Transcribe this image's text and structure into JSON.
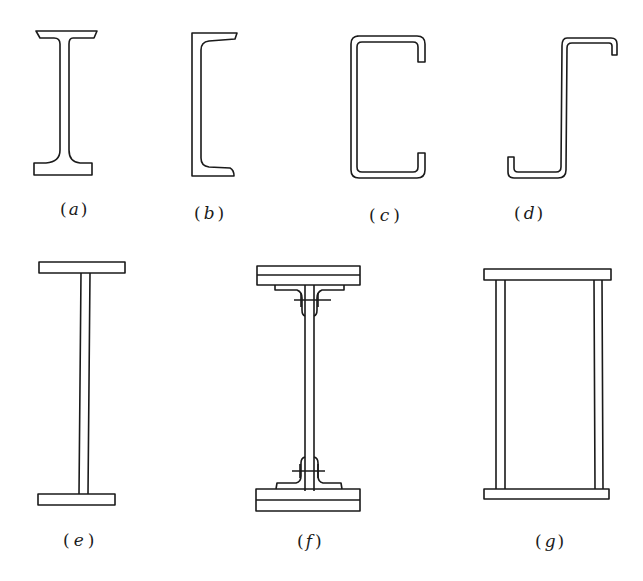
{
  "figure": {
    "sections": [
      {
        "id": "a",
        "label": "(a)",
        "letter": "a",
        "paren_open": "(",
        "paren_close": ")",
        "type": "rolled I-beam"
      },
      {
        "id": "b",
        "label": "(b)",
        "letter": "b",
        "paren_open": "(",
        "paren_close": ")",
        "type": "rolled channel"
      },
      {
        "id": "c",
        "label": "(c)",
        "letter": "c",
        "paren_open": "(",
        "paren_close": ")",
        "type": "cold-formed lipped channel"
      },
      {
        "id": "d",
        "label": "(d)",
        "letter": "d",
        "paren_open": "(",
        "paren_close": ")",
        "type": "cold-formed lipped Z-section"
      },
      {
        "id": "e",
        "label": "(e)",
        "letter": "e",
        "paren_open": "(",
        "paren_close": ")",
        "type": "welded I-section"
      },
      {
        "id": "f",
        "label": "(f)",
        "letter": "f",
        "paren_open": "(",
        "paren_close": ")",
        "type": "riveted built-up I-section"
      },
      {
        "id": "g",
        "label": "(g)",
        "letter": "g",
        "paren_open": "(",
        "paren_close": ")",
        "type": "welded box section"
      }
    ],
    "colors": {
      "line": "#1a1a1a",
      "background": "#ffffff"
    }
  }
}
